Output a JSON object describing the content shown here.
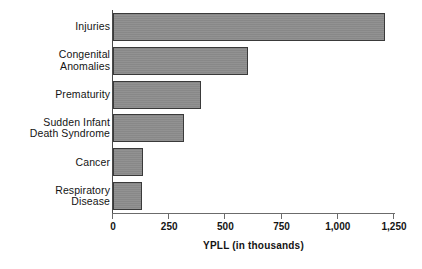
{
  "chart_data": {
    "type": "bar",
    "orientation": "horizontal",
    "title": "",
    "xlabel": "YPLL (in thousands)",
    "ylabel": "",
    "xlim": [
      0,
      1250
    ],
    "xticks": [
      0,
      250,
      500,
      750,
      1000,
      1250
    ],
    "xticklabels": [
      "0",
      "250",
      "500",
      "750",
      "1,000",
      "1,250"
    ],
    "grid": false,
    "legend": null,
    "categories": [
      "Injuries",
      "Congenital\nAnomalies",
      "Prematurity",
      "Sudden Infant\nDeath Syndrome",
      "Cancer",
      "Respiratory\nDisease"
    ],
    "values": [
      1210,
      600,
      390,
      315,
      132,
      130
    ],
    "bar_color": "#8d8d8d",
    "bar_edge_color": "#3a3a3a",
    "axis_color": "#6b6b6b"
  }
}
